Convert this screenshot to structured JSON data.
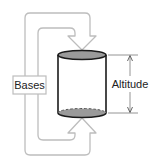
{
  "diagram": {
    "labels": {
      "bases": "Bases",
      "altitude": "Altitude"
    },
    "colors": {
      "background": "#ffffff",
      "bracket_stroke": "#bdbdbd",
      "cylinder_stroke": "#1a1a1a",
      "base_fill": "#9a9a9a",
      "label_box_stroke": "#bdbdbd",
      "dimension_line": "#888888",
      "text": "#222222"
    }
  }
}
